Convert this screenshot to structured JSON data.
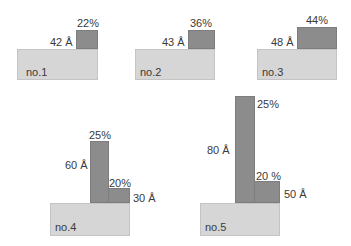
{
  "diagram": {
    "colors": {
      "base": "#d6d6d6",
      "bar": "#8c8c8c",
      "text": "#3a3a3a"
    },
    "items": [
      {
        "name": "no.1",
        "thickness": "42 Å",
        "fraction": "22%"
      },
      {
        "name": "no.2",
        "thickness": "43 Å",
        "fraction": "36%"
      },
      {
        "name": "no.3",
        "thickness": "48 Å",
        "fraction": "44%"
      },
      {
        "name": "no.4",
        "tall_thickness": "60 Å",
        "tall_fraction": "25%",
        "short_thickness": "30 Å",
        "short_fraction": "20%"
      },
      {
        "name": "no.5",
        "tall_thickness": "80 Å",
        "tall_fraction": "25%",
        "short_thickness": "50 Å",
        "short_fraction": "20 %"
      }
    ]
  }
}
